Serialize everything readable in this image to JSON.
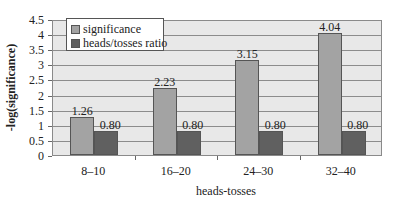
{
  "chart_data": {
    "type": "bar",
    "title": "",
    "xlabel": "heads-tosses",
    "ylabel": "-log(significance)",
    "categories": [
      "8–10",
      "16–20",
      "24–30",
      "32–40"
    ],
    "series": [
      {
        "name": "significance",
        "values": [
          1.26,
          2.23,
          3.15,
          4.04
        ],
        "labels": [
          "1.26",
          "2.23",
          "3.15",
          "4.04"
        ],
        "color": "#a3a3a3"
      },
      {
        "name": "heads/tosses ratio",
        "values": [
          0.8,
          0.8,
          0.8,
          0.8
        ],
        "labels": [
          "0.80",
          "0.80",
          "0.80",
          "0.80"
        ],
        "color": "#606060"
      }
    ],
    "ylim": [
      0,
      4.5
    ],
    "yticks": [
      "0",
      "0.5",
      "1",
      "1.5",
      "2",
      "2.5",
      "3",
      "3.5",
      "4",
      "4.5"
    ],
    "grid": true,
    "legend_position": "upper-left-inside"
  },
  "legend": {
    "items": [
      {
        "label": "significance",
        "color": "#a3a3a3"
      },
      {
        "label": "heads/tosses ratio",
        "color": "#606060"
      }
    ]
  }
}
